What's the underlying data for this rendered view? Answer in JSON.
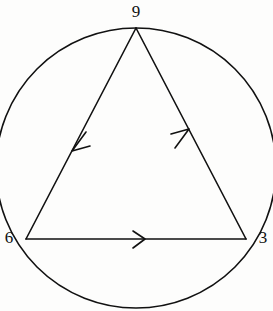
{
  "figure": {
    "name": "circle-with-inscribed-triangle",
    "background_color": "#fdfdfc",
    "stroke_color": "#111111",
    "stroke_width": 1.6,
    "width": 273,
    "height": 311
  },
  "circle": {
    "name": "circumscribed-circle",
    "cx": 136,
    "cy": 168,
    "r": 140,
    "fill": "none",
    "stroke": "#111111"
  },
  "triangle": {
    "name": "inscribed-triangle",
    "fill": "none",
    "stroke": "#111111",
    "vertices": [
      {
        "id": "top",
        "label": "9",
        "x": 136,
        "y": 28,
        "label_x": 136,
        "label_y": 12
      },
      {
        "id": "lower-left",
        "label": "6",
        "x": 26,
        "y": 239,
        "label_x": 9,
        "label_y": 239
      },
      {
        "id": "lower-right",
        "label": "3",
        "x": 246,
        "y": 239,
        "label_x": 263,
        "label_y": 239
      }
    ],
    "edges": [
      {
        "id": "edge-top-to-lower-left",
        "from": "9",
        "to": "6",
        "x1": 136,
        "y1": 28,
        "x2": 26,
        "y2": 239
      },
      {
        "id": "edge-lower-left-to-lower-right",
        "from": "6",
        "to": "3",
        "x1": 26,
        "y1": 239,
        "x2": 246,
        "y2": 239
      },
      {
        "id": "edge-lower-right-to-top",
        "from": "3",
        "to": "9",
        "x1": 246,
        "y1": 239,
        "x2": 136,
        "y2": 28
      }
    ]
  },
  "arrow_markers": [
    {
      "id": "arrow-on-edge-9-to-6",
      "edge": "edge-top-to-lower-left",
      "direction": "down-left",
      "tip_x": 72,
      "tip_y": 151,
      "points": "86,132 72,151 90,146"
    },
    {
      "id": "arrow-on-edge-6-to-3",
      "edge": "edge-lower-left-to-lower-right",
      "direction": "right",
      "tip_x": 145,
      "tip_y": 239,
      "points": "133,231 145,239 133,248"
    },
    {
      "id": "arrow-on-edge-3-to-9",
      "edge": "edge-lower-right-to-top",
      "direction": "up-right",
      "tip_x": 189,
      "tip_y": 129,
      "points": "175,148 189,129 171,134"
    }
  ],
  "labels": {
    "top": "9",
    "lower_left": "6",
    "lower_right": "3"
  }
}
